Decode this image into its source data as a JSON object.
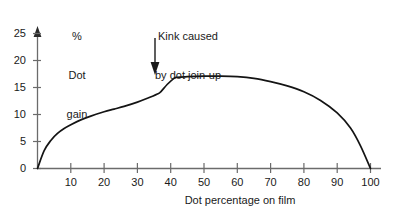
{
  "chart_data": {
    "type": "line",
    "title": "",
    "xlabel": "Dot percentage on film",
    "ylabel": "% Dot gain",
    "ylabel_lines": [
      "%",
      "Dot",
      "gain"
    ],
    "xlim": [
      0,
      100
    ],
    "ylim": [
      0,
      25
    ],
    "grid": false,
    "legend": null,
    "x_ticks": [
      10,
      20,
      30,
      40,
      50,
      60,
      70,
      80,
      90,
      100
    ],
    "x_tick_labels": [
      "10",
      "20",
      "30",
      "40",
      "50",
      "60",
      "70",
      "80",
      "90",
      "100"
    ],
    "y_ticks": [
      0,
      5,
      10,
      15,
      20,
      25
    ],
    "y_tick_labels": [
      "0",
      "5",
      "10",
      "15",
      "20",
      "25"
    ],
    "series": [
      {
        "name": "Dot gain curve",
        "x": [
          0,
          2,
          4,
          6,
          8,
          10,
          13,
          16,
          20,
          23,
          26,
          30,
          33,
          36,
          37,
          39,
          41,
          42,
          45,
          50,
          55,
          60,
          65,
          70,
          75,
          80,
          85,
          90,
          94,
          97,
          100
        ],
        "values": [
          0,
          3.3,
          5.2,
          6.5,
          7.4,
          8.1,
          9.0,
          9.7,
          10.5,
          11.0,
          11.5,
          12.3,
          13.0,
          13.8,
          14.2,
          15.6,
          16.7,
          16.9,
          17.0,
          17.1,
          17.1,
          17.0,
          16.7,
          16.1,
          15.3,
          14.2,
          12.6,
          10.3,
          7.5,
          4.2,
          0
        ]
      }
    ],
    "annotations": [
      {
        "text": "Kink caused\nby dot join-up",
        "target_x": 37,
        "target_y": 14.2,
        "arrow": "down"
      }
    ]
  },
  "axes": {
    "y_axis_arrow": true,
    "x_axis_arrow": false,
    "line_color": "#6b6b6b",
    "curve_color": "#141414"
  }
}
